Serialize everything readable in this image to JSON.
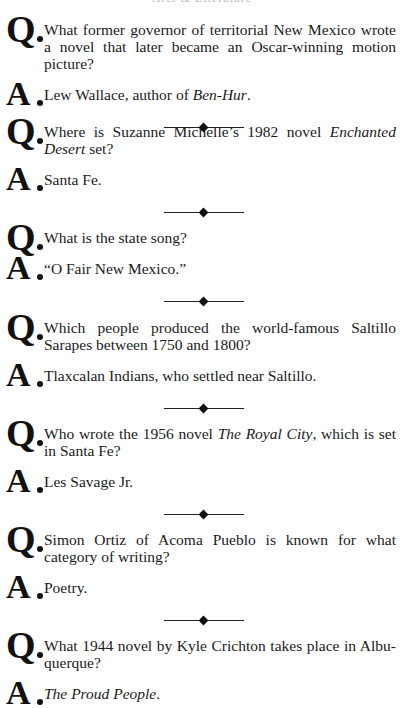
{
  "header": {
    "text": "Arts & Literature"
  },
  "items": [
    {
      "question": "What former governor of territorial New Mexico wrote a novel that later became an Oscar-winning motion picture?",
      "answer_pre": "Lew Wallace, author of ",
      "answer_italic": "Ben-Hur",
      "answer_post": "."
    },
    {
      "question_pre": "Where is Suzanne Michelle’s 1982 novel ",
      "question_italic": "Enchanted Desert",
      "question_post": " set?",
      "answer": "Santa Fe."
    },
    {
      "question": "What is the state song?",
      "answer": "“O Fair New Mexico.”"
    },
    {
      "question": "Which people produced the world-famous Saltillo Sarapes between 1750 and 1800?",
      "answer": "Tlaxcalan Indians, who settled near Saltillo."
    },
    {
      "question_pre": "Who wrote the 1956 novel ",
      "question_italic": "The Royal City",
      "question_post": ", which is set in Santa Fe?",
      "answer": "Les Savage Jr."
    },
    {
      "question": "Simon Ortiz of Acoma Pueblo is known for what category of writing?",
      "answer": "Poetry."
    },
    {
      "question": "What 1944 novel by Kyle Crichton takes place in Albu-querque?",
      "answer_italic": "The Proud People",
      "answer_post": "."
    }
  ],
  "labels": {
    "q": "Q",
    "a": "A"
  },
  "divider_icon": "diamond-rule-icon"
}
